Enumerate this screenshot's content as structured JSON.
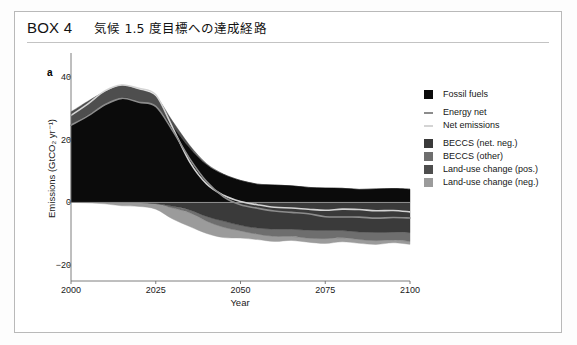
{
  "box": {
    "number": "BOX 4",
    "title": "気候 1.5 度目標への達成経路"
  },
  "panel": {
    "label": "a"
  },
  "legend": {
    "items": [
      {
        "label": "Fossil fuels",
        "color": "#0b0b0b",
        "type": "area"
      },
      {
        "label": "Energy net",
        "color": "#8c8c8c",
        "type": "line"
      },
      {
        "label": "Net emissions",
        "color": "#d4d4d4",
        "type": "line"
      },
      {
        "label": "BECCS (net. neg.)",
        "color": "#3a3a3a",
        "type": "area"
      },
      {
        "label": "BECCS (other)",
        "color": "#6e6e6e",
        "type": "area"
      },
      {
        "label": "Land-use change (pos.)",
        "color": "#4e4e4e",
        "type": "area"
      },
      {
        "label": "Land-use change (neg.)",
        "color": "#9b9b9b",
        "type": "area"
      }
    ]
  },
  "chart_data": {
    "type": "area",
    "title": "",
    "xlabel": "Year",
    "ylabel": "Emissions (GtCO₂ yr⁻¹)",
    "xlim": [
      2000,
      2100
    ],
    "ylim": [
      -25,
      45
    ],
    "xticks": [
      2000,
      2025,
      2050,
      2075,
      2100
    ],
    "yticks": [
      40,
      20,
      0,
      -20
    ],
    "ytick_labels": [
      "40",
      "20",
      "0",
      "−20"
    ],
    "grid": false,
    "zero_line": true,
    "legend_position": "right",
    "x": [
      2000,
      2005,
      2010,
      2015,
      2020,
      2025,
      2030,
      2035,
      2040,
      2045,
      2050,
      2055,
      2060,
      2065,
      2070,
      2075,
      2080,
      2085,
      2090,
      2095,
      2100
    ],
    "series": [
      {
        "name": "Fossil fuels",
        "color": "#0b0b0b",
        "stack": "positive",
        "values": [
          24.5,
          27.5,
          31.0,
          33.5,
          32.0,
          30.5,
          24.0,
          17.0,
          12.0,
          9.0,
          7.0,
          6.0,
          5.5,
          5.0,
          4.8,
          4.6,
          4.5,
          4.4,
          4.3,
          4.2,
          4.2
        ]
      },
      {
        "name": "Land-use change (pos.)",
        "color": "#4e4e4e",
        "stack": "positive",
        "values": [
          4.5,
          4.3,
          4.2,
          4.0,
          3.8,
          3.5,
          2.0,
          0.8,
          0.3,
          0.1,
          0.0,
          0.0,
          0.0,
          0.0,
          0.0,
          0.0,
          0.0,
          0.0,
          0.0,
          0.0,
          0.0
        ]
      },
      {
        "name": "BECCS (net. neg.)",
        "color": "#3a3a3a",
        "stack": "negative",
        "values": [
          0.0,
          0.0,
          0.0,
          0.0,
          0.0,
          -0.2,
          -1.0,
          -2.5,
          -4.5,
          -6.0,
          -7.5,
          -8.0,
          -8.3,
          -8.6,
          -8.8,
          -9.0,
          -9.2,
          -9.3,
          -9.4,
          -9.5,
          -9.5
        ]
      },
      {
        "name": "BECCS (other)",
        "color": "#6e6e6e",
        "stack": "negative",
        "values": [
          0.0,
          0.0,
          0.0,
          0.0,
          0.0,
          -0.1,
          -0.4,
          -0.9,
          -1.4,
          -1.8,
          -2.0,
          -2.1,
          -2.2,
          -2.3,
          -2.4,
          -2.4,
          -2.5,
          -2.5,
          -2.6,
          -2.6,
          -2.6
        ]
      },
      {
        "name": "Land-use change (neg.)",
        "color": "#9b9b9b",
        "stack": "negative",
        "values": [
          0.0,
          -0.2,
          -0.5,
          -0.8,
          -1.2,
          -2.0,
          -3.5,
          -4.5,
          -4.0,
          -3.0,
          -2.2,
          -1.8,
          -1.6,
          -1.5,
          -1.4,
          -1.3,
          -1.2,
          -1.2,
          -1.1,
          -1.1,
          -1.1
        ]
      }
    ],
    "lines": [
      {
        "name": "Net emissions",
        "color": "#d4d4d4",
        "values": [
          28.0,
          31.5,
          35.5,
          37.5,
          36.0,
          34.0,
          24.0,
          13.0,
          6.0,
          2.5,
          0.0,
          -1.0,
          -1.4,
          -1.8,
          -2.0,
          -2.2,
          -2.4,
          -2.5,
          -2.6,
          -2.7,
          -2.8
        ]
      },
      {
        "name": "Energy net",
        "color": "#8c8c8c",
        "values": [
          24.5,
          27.5,
          31.0,
          33.5,
          32.0,
          30.3,
          22.8,
          13.8,
          6.5,
          2.2,
          -0.6,
          -2.0,
          -2.7,
          -3.4,
          -3.8,
          -4.2,
          -4.5,
          -4.7,
          -4.9,
          -5.1,
          -5.2
        ]
      }
    ]
  }
}
